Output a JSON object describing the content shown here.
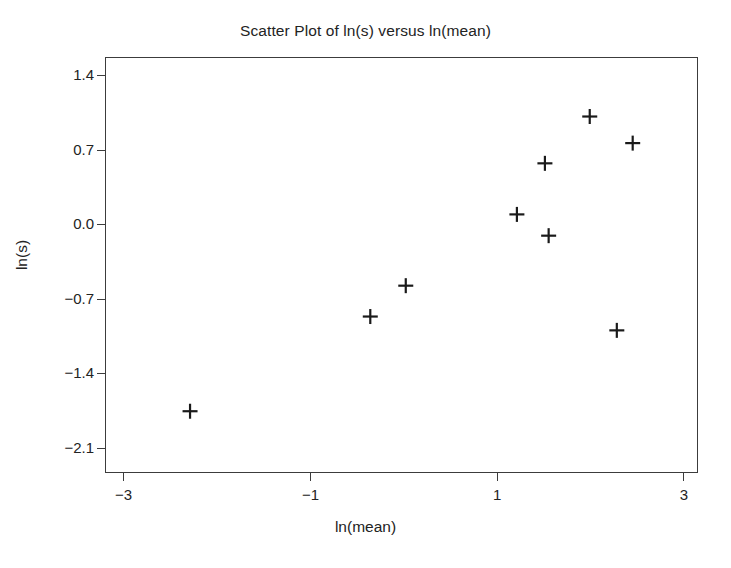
{
  "chart_data": {
    "type": "scatter",
    "title": "Scatter Plot of ln(s) versus ln(mean)",
    "xlabel": "ln(mean)",
    "ylabel": "ln(s)",
    "xlim": [
      -3.2,
      3.15
    ],
    "ylim": [
      -2.33,
      1.58
    ],
    "xticks": [
      -3,
      -1,
      1,
      3
    ],
    "xticklabels": [
      "−3",
      "−1",
      "1",
      "3"
    ],
    "yticks": [
      1.4,
      0.7,
      0.0,
      -0.7,
      -1.4,
      -2.1
    ],
    "yticklabels": [
      "1.4",
      "0.7",
      "0.0",
      "−0.7",
      "−1.4",
      "−2.1"
    ],
    "grid": false,
    "legend": null,
    "marker": "plus",
    "marker_color": "#1a1a1a",
    "frame_color": "#3c3c3c",
    "background": "#ffffff",
    "n_points": 9,
    "x": [
      -2.3,
      -0.37,
      0.01,
      1.2,
      1.5,
      1.54,
      1.98,
      2.27,
      2.44
    ],
    "y": [
      -1.74,
      -0.85,
      -0.56,
      0.11,
      0.59,
      -0.09,
      1.03,
      -0.98,
      0.78
    ],
    "points": [
      {
        "x": -2.3,
        "y": -1.74
      },
      {
        "x": -0.37,
        "y": -0.85
      },
      {
        "x": 0.01,
        "y": -0.56
      },
      {
        "x": 1.2,
        "y": 0.11
      },
      {
        "x": 1.5,
        "y": 0.59
      },
      {
        "x": 1.54,
        "y": -0.09
      },
      {
        "x": 1.98,
        "y": 1.03
      },
      {
        "x": 2.27,
        "y": -0.98
      },
      {
        "x": 2.44,
        "y": 0.78
      }
    ]
  }
}
